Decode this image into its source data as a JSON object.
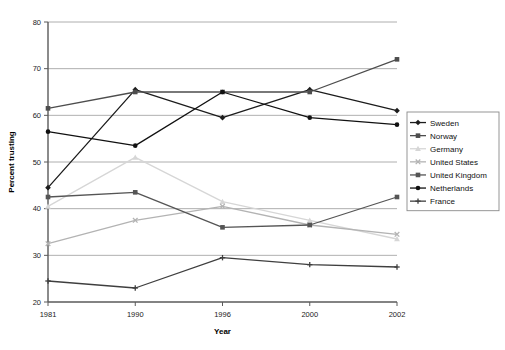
{
  "chart_data": {
    "type": "line",
    "title": "",
    "xlabel": "Year",
    "ylabel": "Percent trusting",
    "categories": [
      "1981",
      "1990",
      "1996",
      "2000",
      "2002"
    ],
    "x": [
      1981,
      1990,
      1996,
      2000,
      2002
    ],
    "ylim": [
      20,
      80
    ],
    "yticks": [
      20,
      30,
      40,
      50,
      60,
      70,
      80
    ],
    "grid": "horizontal",
    "legend_position": "right",
    "series": [
      {
        "name": "Sweden",
        "color": "#1c1c1c",
        "marker": "diamond",
        "values": [
          44.5,
          65.5,
          59.5,
          65.5,
          61.0
        ]
      },
      {
        "name": "Norway",
        "color": "#4d4d4d",
        "marker": "square",
        "values": [
          61.5,
          65.0,
          65.0,
          65.0,
          72.0
        ]
      },
      {
        "name": "Germany",
        "color": "#d6d6d6",
        "marker": "triangle",
        "values": [
          40.5,
          51.0,
          41.5,
          37.5,
          33.5
        ]
      },
      {
        "name": "United States",
        "color": "#b3b3b3",
        "marker": "cross",
        "values": [
          32.5,
          37.5,
          40.5,
          36.5,
          34.5
        ]
      },
      {
        "name": "United Kingdom",
        "color": "#555555",
        "marker": "square",
        "values": [
          42.5,
          43.5,
          36.0,
          36.5,
          42.5
        ]
      },
      {
        "name": "Netherlands",
        "color": "#111111",
        "marker": "circle",
        "values": [
          56.5,
          53.5,
          65.0,
          59.5,
          58.0
        ]
      },
      {
        "name": "France",
        "color": "#3f3f3f",
        "marker": "plus",
        "values": [
          24.5,
          23.0,
          29.5,
          28.0,
          27.5
        ]
      }
    ]
  }
}
